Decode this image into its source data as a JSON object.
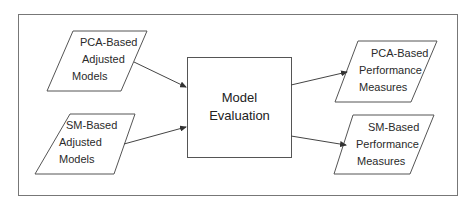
{
  "diagram": {
    "type": "flowchart",
    "inputs": [
      {
        "id": "pca-adjusted-models",
        "lines": [
          "PCA-Based",
          "Adjusted",
          "Models"
        ]
      },
      {
        "id": "sm-adjusted-models",
        "lines": [
          "SM-Based",
          "Adjusted",
          "Models"
        ]
      }
    ],
    "process": {
      "id": "model-evaluation",
      "lines": [
        "Model",
        "Evaluation"
      ]
    },
    "outputs": [
      {
        "id": "pca-performance-measures",
        "lines": [
          "PCA-Based",
          "Performance",
          "Measures"
        ]
      },
      {
        "id": "sm-performance-measures",
        "lines": [
          "SM-Based",
          "Performance",
          "Measures"
        ]
      }
    ],
    "edges": [
      {
        "from": "pca-adjusted-models",
        "to": "model-evaluation"
      },
      {
        "from": "sm-adjusted-models",
        "to": "model-evaluation"
      },
      {
        "from": "model-evaluation",
        "to": "pca-performance-measures"
      },
      {
        "from": "model-evaluation",
        "to": "sm-performance-measures"
      }
    ],
    "colors": {
      "stroke": "#555555",
      "frame": "#777777",
      "background": "#ffffff",
      "text": "#2a2a2a"
    }
  }
}
